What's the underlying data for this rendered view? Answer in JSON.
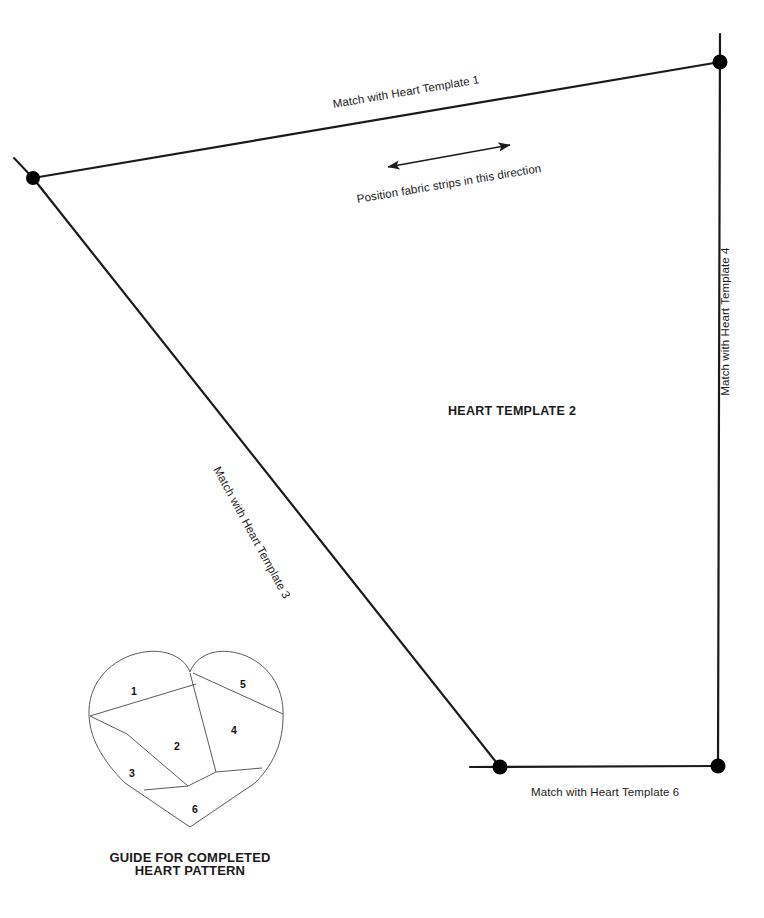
{
  "document": {
    "type": "sewing-pattern-template",
    "title": "HEART TEMPLATE 2",
    "background_color": "#ffffff"
  },
  "colors": {
    "line": "#1a1a1a",
    "heart_line": "#5a5a5a",
    "text": "#1a1a1a",
    "vertex_dot": "#000000"
  },
  "template": {
    "name": "HEART TEMPLATE 2",
    "edge_labels": {
      "top": "Match with Heart Template 1",
      "right": "Match with Heart Template 4",
      "diagonal": "Match with Heart Template 3",
      "bottom": "Match with Heart Template 6"
    },
    "annotation": {
      "arrow": "double-headed-arrow",
      "text": "Position fabric strips in this direction"
    },
    "vertices": [
      {
        "name": "top-left",
        "x": 33,
        "y": 178
      },
      {
        "name": "top-right",
        "x": 720,
        "y": 62
      },
      {
        "name": "bottom-right",
        "x": 718,
        "y": 766
      },
      {
        "name": "bottom-left",
        "x": 500,
        "y": 767
      }
    ]
  },
  "guide": {
    "caption_line_1": "GUIDE FOR COMPLETED",
    "caption_line_2": "HEART PATTERN",
    "regions": [
      {
        "number": "1"
      },
      {
        "number": "2"
      },
      {
        "number": "3"
      },
      {
        "number": "4"
      },
      {
        "number": "5"
      },
      {
        "number": "6"
      }
    ]
  }
}
